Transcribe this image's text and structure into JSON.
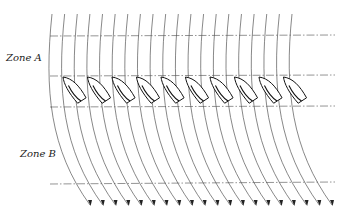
{
  "diagram": {
    "zones": [
      {
        "label": "Zone A"
      },
      {
        "label": "Zone B"
      }
    ],
    "streamline_count": 20,
    "boat_count": 10,
    "reference_line_count": 4,
    "colors": {
      "line": "#555555",
      "boat": "#111111",
      "background": "#ffffff"
    }
  }
}
